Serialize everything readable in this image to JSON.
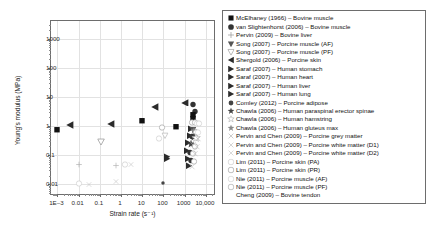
{
  "chart_data": {
    "type": "scatter",
    "title": "",
    "xlabel": "Strain rate (s⁻¹)",
    "ylabel": "Young's modulus (MPa)",
    "xscale": "log",
    "yscale": "log",
    "xlim": [
      0.0005,
      30000
    ],
    "ylim": [
      0.004,
      4000
    ],
    "grid": true,
    "legend_position": "right-outside",
    "xticks": [
      "1E–3",
      "0.01",
      "0.1",
      "1",
      "10",
      "100",
      "1000",
      "10,000"
    ],
    "xtick_values": [
      0.001,
      0.01,
      0.1,
      1,
      10,
      100,
      1000,
      10000
    ],
    "yticks": [
      "0.01",
      "0.1",
      "1",
      "10",
      "100",
      "1000"
    ],
    "ytick_values": [
      0.01,
      0.1,
      1,
      10,
      100,
      1000
    ],
    "series": [
      {
        "name": "McElhaney (1966) – Bovine muscle",
        "marker": "filled-square",
        "color": "#111111",
        "points": [
          [
            0.001,
            0.8
          ],
          [
            10,
            1.6
          ],
          [
            600,
            1.1
          ],
          [
            1000,
            2.0
          ],
          [
            1500,
            3.0
          ],
          [
            1000,
            2.4
          ]
        ]
      },
      {
        "name": "van Slightenhorst (2006) – Bovine muscle",
        "marker": "filled-circle",
        "color": "#333333",
        "points": [
          [
            1400,
            0.55
          ],
          [
            1800,
            0.62
          ],
          [
            2100,
            0.7
          ]
        ]
      },
      {
        "name": "Pervin (2009) – Bovine liver",
        "marker": "plus",
        "color": "#9a9a9a",
        "points": [
          [
            0.01,
            0.06
          ],
          [
            1,
            0.05
          ],
          [
            1300,
            0.5
          ],
          [
            2000,
            0.55
          ]
        ]
      },
      {
        "name": "Song (2007) – Porcine muscle (AF)",
        "marker": "filled-down-triangle",
        "color": "#555555",
        "points": [
          [
            0.1,
            0.35
          ],
          [
            1500,
            0.9
          ],
          [
            2000,
            1.0
          ]
        ]
      },
      {
        "name": "Song (2007) – Porcine muscle (PF)",
        "marker": "open-down-triangle",
        "color": "#9a9a9a",
        "points": [
          [
            0.1,
            0.22
          ],
          [
            1600,
            0.6
          ],
          [
            2200,
            0.72
          ]
        ]
      },
      {
        "name": "Shergold (2006) – Porcine skin",
        "marker": "filled-left-triangle",
        "color": "#2b2b2b",
        "points": [
          [
            0.004,
            1.2
          ],
          [
            0.4,
            1.3
          ],
          [
            40,
            4.6
          ],
          [
            400,
            1.1
          ],
          [
            3000,
            7.0
          ]
        ]
      },
      {
        "name": "Saraf (2007) – Human stomach",
        "marker": "filled-right-triangle",
        "color": "#2b2b2b",
        "points": [
          [
            1200,
            0.13
          ],
          [
            1600,
            0.1
          ]
        ]
      },
      {
        "name": "Saraf (2007) – Human heart",
        "marker": "filled-right-triangle",
        "color": "#2b2b2b",
        "points": [
          [
            1300,
            0.08
          ],
          [
            1700,
            0.07
          ]
        ]
      },
      {
        "name": "Saraf (2007) – Human liver",
        "marker": "filled-right-triangle",
        "color": "#2b2b2b",
        "points": [
          [
            1250,
            0.06
          ],
          [
            1650,
            0.055
          ]
        ]
      },
      {
        "name": "Saraf (2007) – Human lung",
        "marker": "filled-right-triangle",
        "color": "#2b2b2b",
        "points": [
          [
            1350,
            0.045
          ],
          [
            1750,
            0.04
          ]
        ]
      },
      {
        "name": "Comley (2012) – Porcine adipose",
        "marker": "filled-circle-small",
        "color": "#444444",
        "points": [
          [
            100,
            0.012
          ],
          [
            2000,
            0.03
          ]
        ]
      },
      {
        "name": "Chawla (2006) – Human paraspinal erector spinae",
        "marker": "filled-star",
        "color": "#444444",
        "points": [
          [
            1500,
            0.2
          ],
          [
            2400,
            0.26
          ]
        ]
      },
      {
        "name": "Chawla (2006) – Human hamstring",
        "marker": "open-star",
        "color": "#b0b0b0",
        "points": [
          [
            1550,
            0.17
          ],
          [
            2500,
            0.22
          ]
        ]
      },
      {
        "name": "Chawla (2006) – Human gluteus max",
        "marker": "grey-star",
        "color": "#8a8a8a",
        "points": [
          [
            1600,
            0.15
          ],
          [
            2600,
            0.19
          ]
        ]
      },
      {
        "name": "Pervin and Chen (2009) – Porcine grey matter",
        "marker": "cross",
        "color": "#b5b5b5",
        "points": [
          [
            0.01,
            0.02
          ],
          [
            1,
            0.035
          ],
          [
            1400,
            0.3
          ]
        ]
      },
      {
        "name": "Pervin and Chen (2009) – Porcine white matter (D1)",
        "marker": "cross-light",
        "color": "#c2c2c2",
        "points": [
          [
            0.01,
            0.015
          ],
          [
            1,
            0.03
          ],
          [
            1500,
            0.26
          ]
        ]
      },
      {
        "name": "Pervin and Chen (2009) – Porcine white matter (D2)",
        "marker": "cross-light",
        "color": "#c9c9c9",
        "points": [
          [
            0.01,
            0.013
          ],
          [
            1,
            0.026
          ],
          [
            1600,
            0.24
          ]
        ]
      },
      {
        "name": "Lim (2011) – Porcine skin (PA)",
        "marker": "open-circle-light",
        "color": "#c2c2c2",
        "points": [
          [
            900,
            0.75
          ],
          [
            1200,
            0.85
          ],
          [
            1500,
            0.95
          ]
        ]
      },
      {
        "name": "Lim (2011) – Porcine skin (PR)",
        "marker": "open-circle",
        "color": "#9a9a9a",
        "points": [
          [
            1000,
            0.68
          ],
          [
            1300,
            0.78
          ],
          [
            1700,
            0.9
          ]
        ]
      },
      {
        "name": "Nie (2011) – Porcine muscle (AF)",
        "marker": "open-circle-light",
        "color": "#c9c9c9",
        "points": [
          [
            1100,
            0.45
          ],
          [
            1400,
            0.5
          ]
        ]
      },
      {
        "name": "Nie (2011) – Porcine muscle (PF)",
        "marker": "open-circle",
        "color": "#a5a5a5",
        "points": [
          [
            1150,
            0.4
          ],
          [
            1450,
            0.44
          ]
        ]
      },
      {
        "name": "Cheng (2009) – Bovine tendon",
        "marker": "none",
        "color": "#ffffff",
        "points": []
      }
    ],
    "scatter_points": [
      {
        "x": 0.001,
        "y": 0.8,
        "m": "filled-square",
        "c": "#111111",
        "s": 3.4
      },
      {
        "x": 0.004,
        "y": 1.15,
        "m": "filled-left-triangle",
        "c": "#2b2b2b",
        "s": 3.6
      },
      {
        "x": 0.35,
        "y": 1.25,
        "m": "filled-left-triangle",
        "c": "#2b2b2b",
        "s": 3.6
      },
      {
        "x": 0.12,
        "y": 0.32,
        "m": "open-down-triangle",
        "c": "#8a8a8a",
        "s": 3.4
      },
      {
        "x": 10,
        "y": 1.7,
        "m": "filled-square",
        "c": "#111111",
        "s": 3.4
      },
      {
        "x": 40,
        "y": 4.8,
        "m": "filled-left-triangle",
        "c": "#2b2b2b",
        "s": 3.6
      },
      {
        "x": 90,
        "y": 1.0,
        "m": "open-circle",
        "c": "#9a9a9a",
        "s": 3.2
      },
      {
        "x": 120,
        "y": 0.55,
        "m": "open-down-triangle",
        "c": "#b0b0b0",
        "s": 3.2
      },
      {
        "x": 60,
        "y": 0.42,
        "m": "open-circle-light",
        "c": "#c2c2c2",
        "s": 3.2
      },
      {
        "x": 400,
        "y": 1.05,
        "m": "filled-square",
        "c": "#111111",
        "s": 3.4
      },
      {
        "x": 1000,
        "y": 7.0,
        "m": "filled-left-triangle",
        "c": "#2b2b2b",
        "s": 3.6
      },
      {
        "x": 2600,
        "y": 6.2,
        "m": "filled-circle",
        "c": "#333333",
        "s": 3.2
      },
      {
        "x": 3000,
        "y": 3.6,
        "m": "filled-circle",
        "c": "#333333",
        "s": 3.2
      },
      {
        "x": 2500,
        "y": 2.6,
        "m": "filled-square",
        "c": "#111111",
        "s": 3.4
      },
      {
        "x": 2500,
        "y": 2.0,
        "m": "filled-square",
        "c": "#111111",
        "s": 3.4
      },
      {
        "x": 2200,
        "y": 1.5,
        "m": "open-circle",
        "c": "#9a9a9a",
        "s": 3.2
      },
      {
        "x": 3000,
        "y": 1.45,
        "m": "open-circle",
        "c": "#9a9a9a",
        "s": 3.2
      },
      {
        "x": 3800,
        "y": 1.4,
        "m": "open-circle-light",
        "c": "#c2c2c2",
        "s": 3.2
      },
      {
        "x": 4600,
        "y": 1.35,
        "m": "open-circle-light",
        "c": "#c2c2c2",
        "s": 3.2
      },
      {
        "x": 2000,
        "y": 0.9,
        "m": "filled-right-triangle",
        "c": "#2b2b2b",
        "s": 3.4
      },
      {
        "x": 2400,
        "y": 0.8,
        "m": "filled-down-triangle",
        "c": "#555555",
        "s": 3.4
      },
      {
        "x": 2900,
        "y": 0.75,
        "m": "grey-star",
        "c": "#8a8a8a",
        "s": 3.4
      },
      {
        "x": 3600,
        "y": 0.7,
        "m": "open-circle",
        "c": "#a5a5a5",
        "s": 3.2
      },
      {
        "x": 4400,
        "y": 0.68,
        "m": "open-circle-light",
        "c": "#c9c9c9",
        "s": 3.2
      },
      {
        "x": 1700,
        "y": 0.52,
        "m": "filled-right-triangle",
        "c": "#2b2b2b",
        "s": 3.4
      },
      {
        "x": 2100,
        "y": 0.48,
        "m": "filled-circle",
        "c": "#333333",
        "s": 3.2
      },
      {
        "x": 2700,
        "y": 0.45,
        "m": "filled-star",
        "c": "#444444",
        "s": 3.6
      },
      {
        "x": 3400,
        "y": 0.42,
        "m": "open-star",
        "c": "#b0b0b0",
        "s": 3.6
      },
      {
        "x": 4200,
        "y": 0.4,
        "m": "cross",
        "c": "#b5b5b5",
        "s": 3.4
      },
      {
        "x": 1500,
        "y": 0.3,
        "m": "filled-right-triangle",
        "c": "#2b2b2b",
        "s": 3.4
      },
      {
        "x": 1900,
        "y": 0.27,
        "m": "filled-star",
        "c": "#444444",
        "s": 3.6
      },
      {
        "x": 2500,
        "y": 0.25,
        "m": "cross",
        "c": "#b5b5b5",
        "s": 3.4
      },
      {
        "x": 3200,
        "y": 0.23,
        "m": "open-circle",
        "c": "#9a9a9a",
        "s": 3.2
      },
      {
        "x": 4000,
        "y": 0.21,
        "m": "cross-light",
        "c": "#c9c9c9",
        "s": 3.4
      },
      {
        "x": 1300,
        "y": 0.16,
        "m": "filled-right-triangle",
        "c": "#2b2b2b",
        "s": 3.4
      },
      {
        "x": 1800,
        "y": 0.14,
        "m": "filled-circle",
        "c": "#333333",
        "s": 3.2
      },
      {
        "x": 2400,
        "y": 0.13,
        "m": "open-circle",
        "c": "#a5a5a5",
        "s": 3.2
      },
      {
        "x": 3100,
        "y": 0.12,
        "m": "cross-light",
        "c": "#c2c2c2",
        "s": 3.4
      },
      {
        "x": 1400,
        "y": 0.085,
        "m": "filled-right-triangle",
        "c": "#2b2b2b",
        "s": 3.4
      },
      {
        "x": 2000,
        "y": 0.075,
        "m": "filled-circle",
        "c": "#333333",
        "s": 3.2
      },
      {
        "x": 2800,
        "y": 0.07,
        "m": "open-circle",
        "c": "#9a9a9a",
        "s": 3.2
      },
      {
        "x": 1600,
        "y": 0.05,
        "m": "filled-right-triangle",
        "c": "#2b2b2b",
        "s": 3.4
      },
      {
        "x": 2300,
        "y": 0.045,
        "m": "cross-light",
        "c": "#c9c9c9",
        "s": 3.4
      },
      {
        "x": 0.01,
        "y": 0.055,
        "m": "plus",
        "c": "#b0b0b0",
        "s": 3.2
      },
      {
        "x": 0.01,
        "y": 0.012,
        "m": "open-circle-light",
        "c": "#c2c2c2",
        "s": 3.2
      },
      {
        "x": 0.03,
        "y": 0.011,
        "m": "cross-light",
        "c": "#c9c9c9",
        "s": 3.2
      },
      {
        "x": 0.6,
        "y": 0.05,
        "m": "plus",
        "c": "#b5b5b5",
        "s": 3.2
      },
      {
        "x": 0.6,
        "y": 0.014,
        "m": "cross-light",
        "c": "#c9c9c9",
        "s": 3.2
      },
      {
        "x": 1.5,
        "y": 0.055,
        "m": "open-circle-light",
        "c": "#c2c2c2",
        "s": 3.2
      },
      {
        "x": 100,
        "y": 0.0125,
        "m": "filled-circle-small",
        "c": "#444444",
        "s": 2.8
      },
      {
        "x": 140,
        "y": 0.1,
        "m": "filled-right-triangle",
        "c": "#2b2b2b",
        "s": 3.4
      },
      {
        "x": 150,
        "y": 0.085,
        "m": "filled-right-triangle",
        "c": "#2b2b2b",
        "s": 3.4
      },
      {
        "x": 3,
        "y": 0.052,
        "m": "cross-light",
        "c": "#c9c9c9",
        "s": 3.2
      }
    ]
  },
  "legend": {
    "items": [
      {
        "label": "McElhaney (1966) – Bovine muscle",
        "marker": "filled-square",
        "color": "#111111"
      },
      {
        "label": "van Slightenhorst (2006) – Bovine muscle",
        "marker": "filled-circle",
        "color": "#333333"
      },
      {
        "label": "Pervin (2009) – Bovine liver",
        "marker": "plus",
        "color": "#9a9a9a"
      },
      {
        "label": "Song (2007) – Porcine muscle (AF)",
        "marker": "filled-down-triangle",
        "color": "#555555"
      },
      {
        "label": "Song (2007) – Porcine muscle (PF)",
        "marker": "open-down-triangle",
        "color": "#9a9a9a"
      },
      {
        "label": "Shergold (2006) – Porcine skin",
        "marker": "filled-left-triangle",
        "color": "#2b2b2b"
      },
      {
        "label": "Saraf (2007) – Human stomach",
        "marker": "filled-right-triangle",
        "color": "#2b2b2b"
      },
      {
        "label": "Saraf (2007) – Human heart",
        "marker": "filled-right-triangle",
        "color": "#2b2b2b"
      },
      {
        "label": "Saraf (2007) – Human liver",
        "marker": "filled-right-triangle",
        "color": "#2b2b2b"
      },
      {
        "label": "Saraf (2007) – Human lung",
        "marker": "filled-right-triangle",
        "color": "#2b2b2b"
      },
      {
        "label": "Comley (2012) – Porcine adipose",
        "marker": "filled-circle-small",
        "color": "#444444"
      },
      {
        "label": "Chawla (2006) – Human paraspinal erector spinae",
        "marker": "filled-star",
        "color": "#444444"
      },
      {
        "label": "Chawla (2006) – Human hamstring",
        "marker": "open-star",
        "color": "#b0b0b0"
      },
      {
        "label": "Chawla (2006) – Human gluteus max",
        "marker": "grey-star",
        "color": "#8a8a8a"
      },
      {
        "label": "Pervin and Chen (2009) – Porcine grey matter",
        "marker": "cross",
        "color": "#b5b5b5"
      },
      {
        "label": "Pervin and Chen (2009) – Porcine white matter (D1)",
        "marker": "cross-light",
        "color": "#c2c2c2"
      },
      {
        "label": "Pervin and Chen (2009) – Porcine white matter (D2)",
        "marker": "cross-light",
        "color": "#c9c9c9"
      },
      {
        "label": "Lim (2011) – Porcine skin (PA)",
        "marker": "open-circle-light",
        "color": "#c2c2c2"
      },
      {
        "label": "Lim (2011) – Porcine skin (PR)",
        "marker": "open-circle",
        "color": "#9a9a9a"
      },
      {
        "label": "Nie (2011) – Porcine muscle (AF)",
        "marker": "open-circle-light",
        "color": "#c9c9c9"
      },
      {
        "label": "Nie (2011) – Porcine muscle (PF)",
        "marker": "open-circle",
        "color": "#a5a5a5"
      },
      {
        "label": "Cheng (2009) – Bovine tendon",
        "marker": "none",
        "color": "#ffffff"
      }
    ]
  }
}
